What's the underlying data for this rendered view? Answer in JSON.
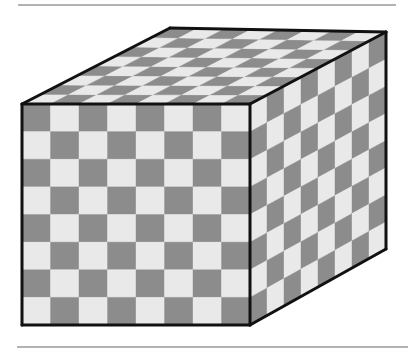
{
  "figure": {
    "grid": {
      "rows": 8,
      "cols": 8
    },
    "colors": {
      "dark": "#8c8c8c",
      "light": "#e9e9e9",
      "edge": "#111111",
      "rule": "#9a9a9a",
      "background": "#ffffff"
    },
    "rules": {
      "top": {
        "x1": 18,
        "x2": 396,
        "y": 5
      },
      "bottom": {
        "x1": 17,
        "x2": 408,
        "y": 347
      }
    },
    "vertices": {
      "front_top_left": [
        22,
        104
      ],
      "front_top_right": [
        250,
        104
      ],
      "front_bottom_right": [
        250,
        325
      ],
      "front_bottom_left": [
        22,
        325
      ],
      "back_top_left": [
        170,
        28
      ],
      "back_top_right": [
        386,
        32
      ],
      "back_bottom_right": [
        386,
        249
      ]
    },
    "faces": [
      {
        "name": "front",
        "origin_dark": true
      },
      {
        "name": "top",
        "origin_dark": false
      },
      {
        "name": "side",
        "origin_dark": false
      }
    ]
  }
}
